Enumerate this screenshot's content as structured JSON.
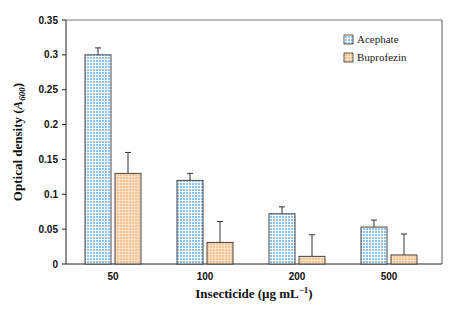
{
  "chart_data": {
    "type": "bar",
    "title": "",
    "xlabel": "Insecticide (μg mL⁻¹)",
    "xlabel_parts": {
      "main": "Insecticide (μg mL",
      "sup": "−1",
      "close": ")"
    },
    "ylabel": "Optical density (A600)",
    "ylabel_parts": {
      "main": "Optical density (",
      "italic": "A",
      "sub": "600",
      "close": ")"
    },
    "categories": [
      "50",
      "100",
      "200",
      "500"
    ],
    "series": [
      {
        "name": "Acephate",
        "values": [
          0.3,
          0.12,
          0.072,
          0.053
        ],
        "errors": [
          0.01,
          0.01,
          0.01,
          0.01
        ],
        "color": "#a9d1ee",
        "pattern": "checker"
      },
      {
        "name": "Buprofezin",
        "values": [
          0.13,
          0.031,
          0.011,
          0.013
        ],
        "errors": [
          0.03,
          0.03,
          0.031,
          0.03
        ],
        "color": "#f7c9a0",
        "pattern": "checker"
      }
    ],
    "ylim": [
      0,
      0.35
    ],
    "yticks": [
      0,
      0.05,
      0.1,
      0.15,
      0.2,
      0.25,
      0.3,
      0.35
    ],
    "ytick_labels": [
      "0",
      "0.05",
      "0.1",
      "0.15",
      "0.2",
      "0.25",
      "0.3",
      "0.35"
    ],
    "grid": false,
    "legend": {
      "placement": "top-right",
      "entries": [
        "Acephate",
        "Buprofezin"
      ]
    }
  }
}
